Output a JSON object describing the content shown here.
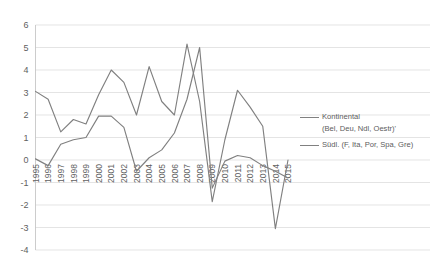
{
  "chart_data": {
    "type": "line",
    "title": "",
    "xlabel": "",
    "ylabel": "",
    "ylim": [
      -4,
      6
    ],
    "ytick_step": 1,
    "grid": true,
    "legend_position": "right",
    "categories": [
      "1995",
      "1996",
      "1997",
      "1998",
      "1999",
      "2000",
      "2001",
      "2002",
      "2003",
      "2004",
      "2005",
      "2006",
      "2007",
      "2008",
      "2009",
      "2010",
      "2011",
      "2012",
      "2013",
      "2014",
      "2015"
    ],
    "yticks": [
      "6",
      "5",
      "4",
      "3",
      "2",
      "1",
      "0",
      "-1",
      "-2",
      "-3",
      "-4"
    ],
    "series": [
      {
        "name": "Kontinental",
        "sublabel": "(Bel, Deu, Ndl, Oestr)'",
        "color": "#808080",
        "values": [
          0.05,
          -0.25,
          0.7,
          0.9,
          1.0,
          1.95,
          1.95,
          1.45,
          -0.5,
          0.1,
          0.45,
          1.2,
          2.7,
          5.0,
          -1.25,
          -0.05,
          0.2,
          0.1,
          -0.25,
          -0.5,
          -0.8
        ]
      },
      {
        "name": "Südl.",
        "sublabel": "(F, Ita, Por, Spa, Gre)",
        "color": "#808080",
        "values": [
          3.05,
          2.7,
          1.25,
          1.8,
          1.6,
          2.9,
          4.0,
          3.45,
          2.0,
          4.15,
          2.6,
          2.0,
          5.15,
          2.6,
          -1.85,
          0.9,
          3.1,
          2.35,
          1.5,
          -3.05,
          0.0
        ]
      }
    ]
  },
  "legend": {
    "entries": [
      {
        "label": "Kontinental",
        "sublabel": "(Bel, Deu, Ndl, Oestr)'"
      },
      {
        "label": "Südl. (F, Ita, Por, Spa, Gre)",
        "sublabel": ""
      }
    ]
  },
  "colors": {
    "line": "#808080",
    "grid": "#d9d9d9",
    "axis": "#bfbfbf",
    "text": "#616161",
    "background": "#ffffff"
  }
}
